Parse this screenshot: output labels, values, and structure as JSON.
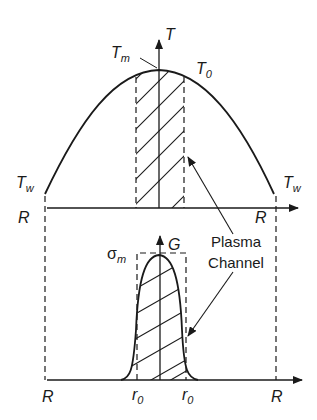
{
  "diagram": {
    "top_plot": {
      "y_axis_label": "T",
      "peak_label_main": "T",
      "peak_label_sub": "m",
      "center_label_main": "T",
      "center_label_sub": "0",
      "wall_left_main": "T",
      "wall_left_sub": "w",
      "wall_right_main": "T",
      "wall_right_sub": "w",
      "x_left_label": "R",
      "x_right_label": "R"
    },
    "bottom_plot": {
      "y_axis_label": "G",
      "peak_label_main": "σ",
      "peak_label_sub": "m",
      "x_left_label": "R",
      "x_right_label": "R",
      "r0_left_main": "r",
      "r0_left_sub": "0",
      "r0_right_main": "r",
      "r0_right_sub": "0"
    },
    "annotation": {
      "line1": "Plasma",
      "line2": "Channel"
    },
    "colors": {
      "ink": "#1a1a1a",
      "background": "#ffffff"
    }
  }
}
